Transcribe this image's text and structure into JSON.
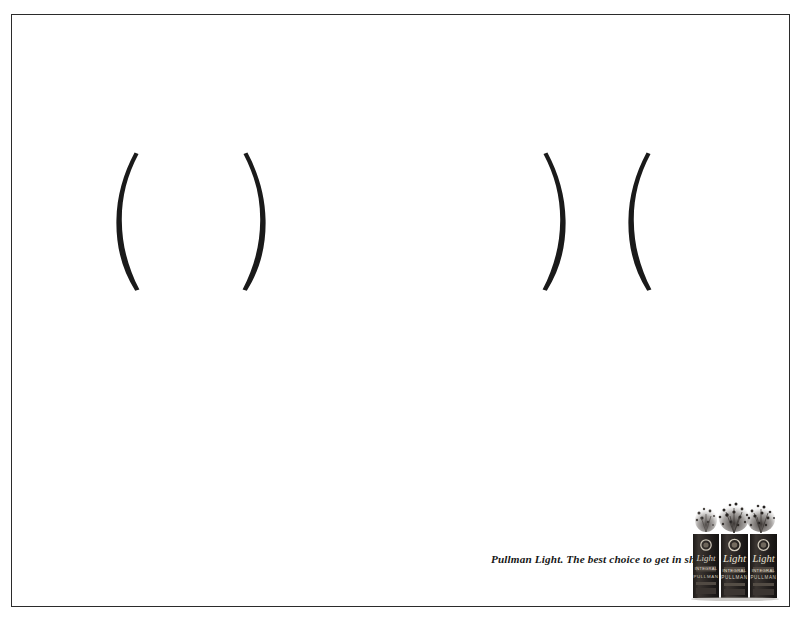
{
  "ad": {
    "brand": "Pullman Light",
    "tagline": "Pullman Light. The best choice to get in shape.",
    "background_color": "#ffffff",
    "frame_color": "#2b2b2b",
    "ink_color": "#1a1a1a"
  },
  "artwork": {
    "description": "Two pairs of large typographic parentheses used as a visual pun for body silhouettes",
    "groups": [
      {
        "id": "wide",
        "glyphs": "( )",
        "open_glyph": "(",
        "close_glyph": ")",
        "meaning": "wide silhouette",
        "position": "left"
      },
      {
        "id": "slim",
        "glyphs": ") (",
        "open_glyph": ")",
        "close_glyph": "(",
        "meaning": "slim silhouette",
        "position": "right"
      }
    ]
  },
  "product": {
    "name": "Light",
    "pack_count": 3,
    "pack_label_script": "Light",
    "pack_label_line_1": "INTEGRAL",
    "pack_label_line_2": "PULLMAN",
    "pack_color": "#2a2623",
    "topping": "bursting grain spray"
  }
}
